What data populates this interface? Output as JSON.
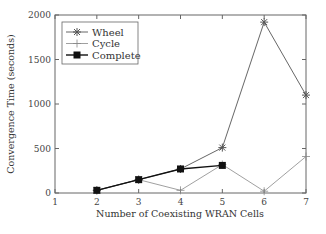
{
  "chart_data": {
    "type": "line",
    "title": "",
    "xlabel": "Number of Coexisting WRAN Cells",
    "ylabel": "Convergence Time (seconds)",
    "xlim": [
      1,
      7
    ],
    "ylim": [
      0,
      2000
    ],
    "x_ticks": [
      1,
      2,
      3,
      4,
      5,
      6,
      7
    ],
    "y_ticks": [
      0,
      500,
      1000,
      1500,
      2000
    ],
    "grid": false,
    "legend_position": "upper left",
    "series": [
      {
        "name": "Wheel",
        "marker": "asterisk",
        "color": "#555555",
        "x": [
          2,
          3,
          4,
          5,
          6,
          7
        ],
        "values": [
          30,
          150,
          270,
          510,
          1920,
          1100
        ]
      },
      {
        "name": "Cycle",
        "marker": "plus",
        "color": "#888888",
        "x": [
          2,
          3,
          4,
          5,
          6,
          7
        ],
        "values": [
          30,
          150,
          30,
          320,
          20,
          410
        ]
      },
      {
        "name": "Complete",
        "marker": "square",
        "color": "#111111",
        "x": [
          2,
          3,
          4,
          5
        ],
        "values": [
          30,
          150,
          270,
          310
        ]
      }
    ]
  }
}
